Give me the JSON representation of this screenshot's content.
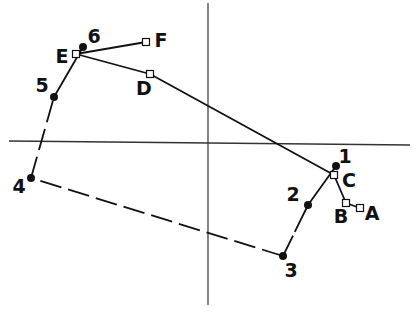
{
  "diagram": {
    "width": 418,
    "height": 316,
    "colors": {
      "ink": "#111111",
      "axis": "#333333",
      "background": "#ffffff"
    },
    "axes": {
      "horizontal": {
        "x1": 9,
        "y1": 141,
        "x2": 410,
        "y2": 145
      },
      "vertical": {
        "x1": 208,
        "y1": 3,
        "x2": 208,
        "y2": 305
      }
    },
    "numbered_points": [
      {
        "id": "1",
        "label": "1",
        "x": 336,
        "y": 166,
        "label_x": 345,
        "label_y": 156
      },
      {
        "id": "2",
        "label": "2",
        "x": 308,
        "y": 205,
        "label_x": 293,
        "label_y": 194
      },
      {
        "id": "3",
        "label": "3",
        "x": 283,
        "y": 256,
        "label_x": 291,
        "label_y": 270
      },
      {
        "id": "4",
        "label": "4",
        "x": 31,
        "y": 178,
        "label_x": 19,
        "label_y": 186
      },
      {
        "id": "5",
        "label": "5",
        "x": 54,
        "y": 97,
        "label_x": 42,
        "label_y": 85
      },
      {
        "id": "6",
        "label": "6",
        "x": 83,
        "y": 47,
        "label_x": 94,
        "label_y": 36
      }
    ],
    "lettered_points": [
      {
        "id": "A",
        "label": "A",
        "x": 360,
        "y": 208,
        "label_x": 372,
        "label_y": 213
      },
      {
        "id": "B",
        "label": "B",
        "x": 346,
        "y": 203,
        "label_x": 341,
        "label_y": 216
      },
      {
        "id": "C",
        "label": "C",
        "x": 334,
        "y": 175,
        "label_x": 349,
        "label_y": 180
      },
      {
        "id": "D",
        "label": "D",
        "x": 150,
        "y": 74,
        "label_x": 144,
        "label_y": 88
      },
      {
        "id": "E",
        "label": "E",
        "x": 76,
        "y": 54,
        "label_x": 62,
        "label_y": 56
      },
      {
        "id": "F",
        "label": "F",
        "x": 146,
        "y": 42,
        "label_x": 161,
        "label_y": 40
      }
    ],
    "solid_path_letters": [
      "A",
      "B",
      "C",
      "D",
      "E",
      "F"
    ],
    "numbered_path": [
      {
        "from": "1",
        "to": "2",
        "style": "solid"
      },
      {
        "from": "2",
        "to": "3",
        "style": "dashed-partial"
      },
      {
        "from": "3",
        "to": "4",
        "style": "dashed"
      },
      {
        "from": "4",
        "to": "5",
        "style": "dashed"
      },
      {
        "from": "5",
        "to": "6",
        "style": "solid"
      }
    ]
  }
}
